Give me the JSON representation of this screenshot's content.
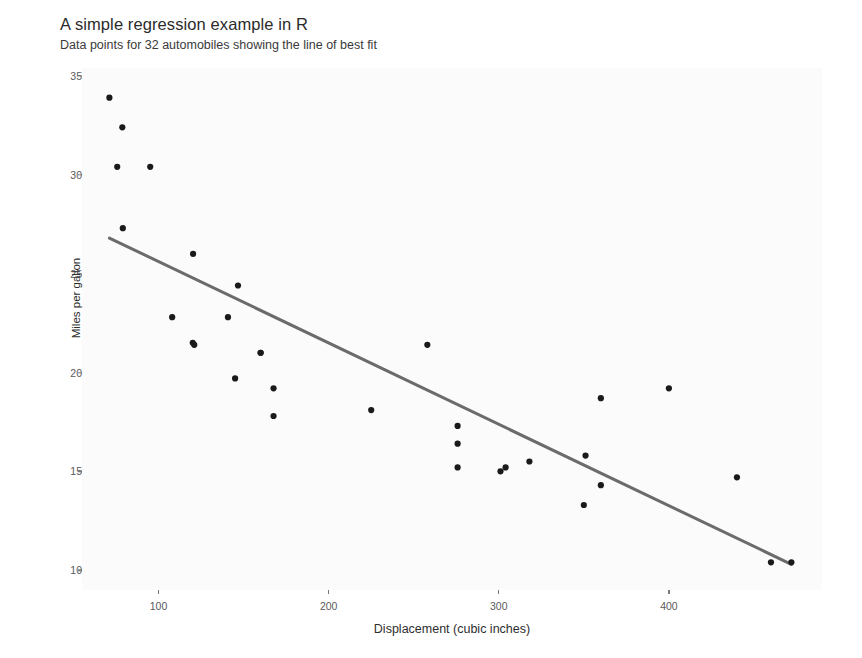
{
  "chart_data": {
    "type": "scatter",
    "title": "A simple regression example in R",
    "subtitle": "Data points for 32 automobiles showing the line of best fit",
    "xlabel": "Displacement (cubic inches)",
    "ylabel": "Miles per gallon",
    "xlim": [
      55,
      490
    ],
    "ylim": [
      9.0,
      35.4
    ],
    "xticks": [
      100,
      200,
      300,
      400
    ],
    "yticks": [
      10,
      15,
      20,
      25,
      30,
      35
    ],
    "grid": false,
    "legend": "none",
    "point_color": "#1a1a1a",
    "point_size": 5,
    "line_color": "#6b6b6b",
    "line_width": 3,
    "panel_background": "#fbfbfb",
    "n_points": 32,
    "series": [
      {
        "name": "automobiles",
        "x": [
          160.0,
          160.0,
          108.0,
          258.0,
          360.0,
          225.0,
          360.0,
          146.7,
          140.8,
          167.6,
          167.6,
          275.8,
          275.8,
          275.8,
          472.0,
          460.0,
          440.0,
          78.7,
          75.7,
          71.1,
          120.1,
          318.0,
          304.0,
          350.0,
          400.0,
          79.0,
          120.3,
          95.1,
          351.0,
          145.0,
          301.0,
          121.0
        ],
        "y": [
          21.0,
          21.0,
          22.8,
          21.4,
          18.7,
          18.1,
          14.3,
          24.4,
          22.8,
          19.2,
          17.8,
          16.4,
          17.3,
          15.2,
          10.4,
          10.4,
          14.7,
          32.4,
          30.4,
          33.9,
          21.5,
          15.5,
          15.2,
          13.3,
          19.2,
          27.3,
          26.0,
          30.4,
          15.8,
          19.7,
          15.0,
          21.4
        ]
      }
    ],
    "fit_line": {
      "name": "line of best fit",
      "x_start": 71.1,
      "x_end": 472.0,
      "y_start": 26.8,
      "y_end": 10.3,
      "intercept": 29.6,
      "slope": -0.0412
    }
  }
}
